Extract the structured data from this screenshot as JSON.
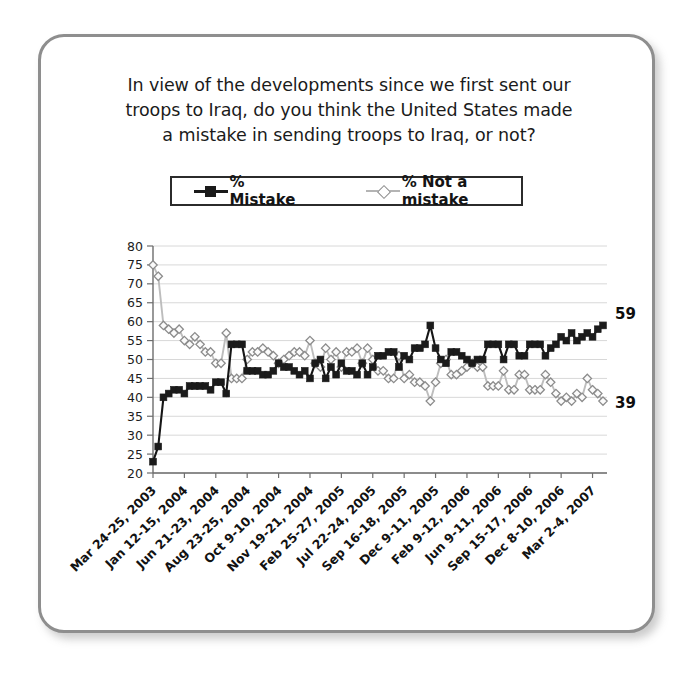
{
  "figure": {
    "title_lines": [
      "In view of the developments since we first sent our",
      "troops to Iraq, do you think the United States made",
      "a mistake in sending troops to Iraq, or not?"
    ]
  },
  "legend": {
    "entries": [
      {
        "label": "% Mistake",
        "marker": "filled-square-marker",
        "color": "#1a1a1a"
      },
      {
        "label": "% Not a mistake",
        "marker": "open-diamond-marker",
        "color": "#b4b4b4"
      }
    ]
  },
  "end_labels": {
    "mistake": "59",
    "not_a_mistake": "39"
  },
  "chart_data": {
    "type": "line",
    "title": "In view of the developments since we first sent our troops to Iraq, do you think the United States made a mistake in sending troops to Iraq, or not?",
    "xlabel": "",
    "ylabel": "",
    "ylim": [
      20,
      80
    ],
    "ytick_step": 5,
    "yticks": [
      20,
      25,
      30,
      35,
      40,
      45,
      50,
      55,
      60,
      65,
      70,
      75,
      80
    ],
    "grid": true,
    "legend_position": "top-center",
    "x_tick_labels": [
      "Mar 24-25, 2003",
      "Jan 12-15, 2004",
      "Jun 21-23, 2004",
      "Aug 23-25, 2004",
      "Oct 9-10, 2004",
      "Nov 19-21, 2004",
      "Feb 25-27, 2005",
      "Jul 22-24, 2005",
      "Sep 16-18, 2005",
      "Dec 9-11, 2005",
      "Feb 9-12, 2006",
      "Jun 9-11, 2006",
      "Sep 15-17, 2006",
      "Dec 8-10, 2006",
      "Mar 2-4, 2007"
    ],
    "x_tick_indices": [
      0,
      6,
      12,
      18,
      24,
      30,
      36,
      42,
      48,
      54,
      60,
      66,
      72,
      78,
      84
    ],
    "series": [
      {
        "name": "% Mistake",
        "color": "#1a1a1a",
        "marker": "filled-square-marker",
        "values": [
          23,
          27,
          40,
          41,
          42,
          42,
          41,
          43,
          43,
          43,
          43,
          42,
          44,
          44,
          41,
          54,
          54,
          54,
          47,
          47,
          47,
          46,
          46,
          47,
          49,
          48,
          48,
          47,
          46,
          47,
          45,
          49,
          50,
          45,
          48,
          46,
          49,
          47,
          47,
          46,
          49,
          46,
          48,
          51,
          51,
          52,
          52,
          48,
          51,
          50,
          53,
          53,
          54,
          59,
          53,
          50,
          49,
          52,
          52,
          51,
          50,
          49,
          50,
          50,
          54,
          54,
          54,
          50,
          54,
          54,
          51,
          51,
          54,
          54,
          54,
          51,
          53,
          54,
          56,
          55,
          57,
          55,
          56,
          57,
          56,
          58,
          59
        ]
      },
      {
        "name": "% Not a mistake",
        "color": "#b4b4b4",
        "marker": "open-diamond-marker",
        "values": [
          75,
          72,
          59,
          58,
          57,
          58,
          55,
          54,
          56,
          54,
          52,
          52,
          49,
          49,
          57,
          45,
          45,
          45,
          50,
          52,
          52,
          53,
          52,
          51,
          49,
          50,
          51,
          52,
          52,
          51,
          55,
          49,
          48,
          53,
          50,
          52,
          48,
          52,
          52,
          53,
          49,
          53,
          50,
          47,
          47,
          45,
          45,
          51,
          45,
          46,
          44,
          44,
          43,
          39,
          44,
          49,
          50,
          46,
          46,
          47,
          48,
          49,
          48,
          48,
          43,
          43,
          43,
          47,
          42,
          42,
          46,
          46,
          42,
          42,
          42,
          46,
          44,
          41,
          39,
          40,
          39,
          41,
          40,
          45,
          42,
          41,
          39
        ]
      }
    ]
  }
}
